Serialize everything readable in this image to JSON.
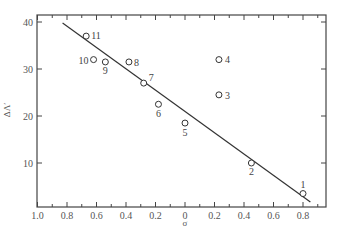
{
  "chart_data": {
    "type": "scatter",
    "title": "",
    "xlabel": "σ",
    "ylabel": "ΔΛ′",
    "x_ticks": [
      "1.0",
      "0.8",
      "0.6",
      "0.4",
      "0.2",
      "0",
      "0.2",
      "0.4",
      "0.6",
      "0.8"
    ],
    "x_tick_values": [
      -1.0,
      -0.8,
      -0.6,
      -0.4,
      -0.2,
      0,
      0.2,
      0.4,
      0.6,
      0.8
    ],
    "y_ticks": [
      "10",
      "20",
      "30",
      "40"
    ],
    "y_tick_values": [
      10,
      20,
      30,
      40
    ],
    "xlim": [
      -1.0,
      0.96
    ],
    "ylim": [
      0.6,
      41.5
    ],
    "grid": false,
    "legend": null,
    "points": [
      {
        "label": "1",
        "x": 0.8,
        "y": 3.5
      },
      {
        "label": "2",
        "x": 0.45,
        "y": 10.0
      },
      {
        "label": "3",
        "x": 0.23,
        "y": 24.5
      },
      {
        "label": "4",
        "x": 0.23,
        "y": 32.0
      },
      {
        "label": "5",
        "x": 0.0,
        "y": 18.5
      },
      {
        "label": "6",
        "x": -0.18,
        "y": 22.5
      },
      {
        "label": "7",
        "x": -0.28,
        "y": 27.0
      },
      {
        "label": "8",
        "x": -0.38,
        "y": 31.5
      },
      {
        "label": "9",
        "x": -0.54,
        "y": 31.5
      },
      {
        "label": "10",
        "x": -0.62,
        "y": 32.0
      },
      {
        "label": "11",
        "x": -0.67,
        "y": 37.0
      }
    ],
    "fit_line": {
      "x": [
        -0.83,
        0.85
      ],
      "y": [
        39.8,
        1.7
      ]
    }
  },
  "colors": {
    "ink": "#444444",
    "background": "#ffffff"
  }
}
